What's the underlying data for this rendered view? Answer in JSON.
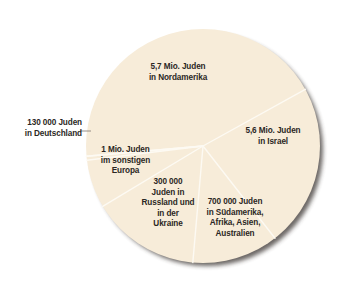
{
  "chart_data": {
    "type": "pie",
    "title": "",
    "unit": "Jewish population by region",
    "colors": {
      "fill": "#f7ecd9",
      "divider": "#fdfaf3",
      "shadow": "#3a3530",
      "text": "#2b2724",
      "leader": "#8a857e"
    },
    "center": [
      203,
      146
    ],
    "radius": 117,
    "slices": [
      {
        "id": "nordamerika",
        "label": "5,7 Mio. Juden\nin Nordamerika",
        "value": 5700000,
        "start_deg": -95,
        "end_deg": 61
      },
      {
        "id": "israel",
        "label": "5,6 Mio. Juden\nin Israel",
        "value": 5600000,
        "start_deg": 61,
        "end_deg": 142
      },
      {
        "id": "suedamerika-afrika-asien-australien",
        "label": "700 000 Juden\nin Südamerika,\nAfrika, Asien,\nAustralien",
        "value": 700000,
        "start_deg": 142,
        "end_deg": 185
      },
      {
        "id": "russland-ukraine",
        "label": "300 000\nJuden in\nRussland und\nin der\nUkraine",
        "value": 300000,
        "start_deg": 185,
        "end_deg": 239
      },
      {
        "id": "sonstiges-europa",
        "label": "1 Mio. Juden\nim sonstigen\nEuropa",
        "value": 1000000,
        "start_deg": 239,
        "end_deg": 263
      },
      {
        "id": "deutschland",
        "label": "130 000 Juden\nin Deutschland",
        "value": 130000,
        "start_deg": 263,
        "end_deg": 265,
        "callout": true
      }
    ]
  },
  "labels": {
    "nordamerika": "5,7 Mio. Juden\nin Nordamerika",
    "israel": "5,6 Mio. Juden\nin Israel",
    "suedamerika": "700 000 Juden\nin Südamerika,\nAfrika, Asien,\nAustralien",
    "russland": "300 000\nJuden in\nRussland und\nin der\nUkraine",
    "europa": "1 Mio. Juden\nim sonstigen\nEuropa",
    "deutschland": "130 000 Juden\nin Deutschland"
  }
}
